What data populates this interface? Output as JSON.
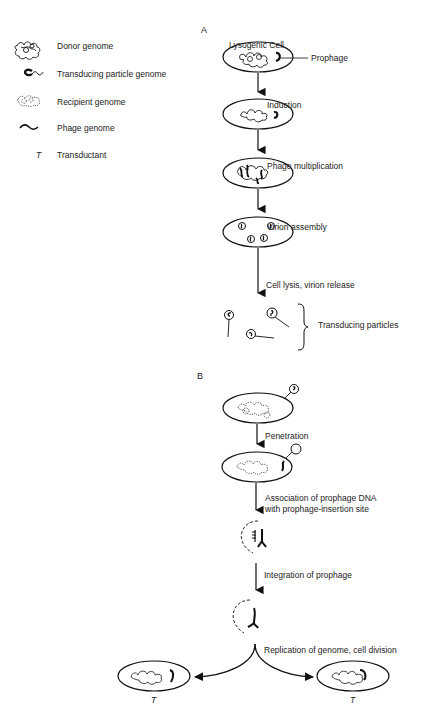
{
  "legend": {
    "items": [
      {
        "icon": "donor-genome-icon",
        "label": "Donor genome"
      },
      {
        "icon": "transducing-particle-genome-icon",
        "label": "Transducing particle genome"
      },
      {
        "icon": "recipient-genome-icon",
        "label": "Recipient genome"
      },
      {
        "icon": "phage-genome-icon",
        "label": "Phage genome"
      },
      {
        "icon": "transductant-symbol",
        "symbol": "T",
        "label": "Transductant"
      }
    ]
  },
  "panel_a": {
    "label": "A",
    "title": "Lysogenic Cell",
    "prophage_label": "Prophage",
    "steps": [
      "Induction",
      "Phage multiplication",
      "Virion assembly",
      "Cell lysis, virion release"
    ],
    "result_label": "Transducing particles"
  },
  "panel_b": {
    "label": "B",
    "steps": [
      "Penetration",
      "Association of prophage DNA",
      "with prophage-insertion site",
      "Integration of prophage",
      "Replication of genome, cell division"
    ],
    "outcomes": [
      {
        "symbol": "T"
      },
      {
        "symbol": "T"
      }
    ]
  }
}
